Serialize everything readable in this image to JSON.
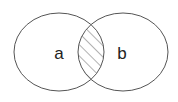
{
  "diagram": {
    "type": "venn",
    "title": "",
    "sets": [
      {
        "label": "a",
        "cx": 59,
        "cy": 52,
        "rx": 45,
        "ry": 39
      },
      {
        "label": "b",
        "cx": 123,
        "cy": 52,
        "rx": 45,
        "ry": 39
      }
    ],
    "highlight": "intersection",
    "highlight_style": "diagonal-hatch",
    "colors": {
      "stroke": "#555555",
      "hatch": "#666666",
      "label": "#222222",
      "background": "#ffffff"
    }
  }
}
